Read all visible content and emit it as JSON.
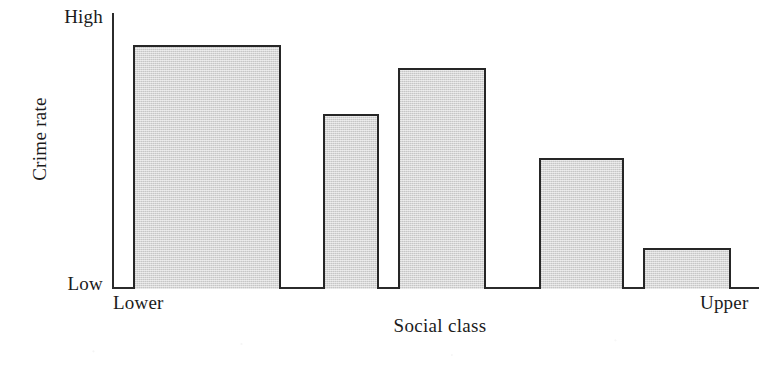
{
  "chart_data": {
    "type": "bar",
    "title": "",
    "xlabel": "Social class",
    "ylabel": "Crime rate",
    "categories": [
      "Lower",
      "",
      "",
      "",
      "Upper"
    ],
    "values": [
      0.88,
      0.63,
      0.8,
      0.47,
      0.14
    ],
    "ylim": [
      0,
      1
    ],
    "y_tick_labels": [
      "Low",
      "High"
    ],
    "x_tick_labels": [
      "Lower",
      "Upper"
    ],
    "grid": false,
    "legend": "none",
    "bar_fill_color": "#d7d7d7",
    "bar_border_color": "#262626",
    "axis_color": "#2b2b2b",
    "background_color": "#ffffff",
    "bars": [
      {
        "name": "bar-1",
        "left_px": 133,
        "width_px": 148,
        "top_px": 45,
        "value": 0.88
      },
      {
        "name": "bar-2",
        "left_px": 323,
        "width_px": 56,
        "top_px": 114,
        "value": 0.63
      },
      {
        "name": "bar-3",
        "left_px": 398,
        "width_px": 88,
        "top_px": 68,
        "value": 0.8
      },
      {
        "name": "bar-4",
        "left_px": 539,
        "width_px": 85,
        "top_px": 158,
        "value": 0.47
      },
      {
        "name": "bar-5",
        "left_px": 643,
        "width_px": 88,
        "top_px": 248,
        "value": 0.14
      }
    ]
  },
  "axis": {
    "y_high_label": "High",
    "y_low_label": "Low",
    "y_title": "Crime rate",
    "x_title": "Social class",
    "x_left_category": "Lower",
    "x_right_category": "Upper"
  }
}
